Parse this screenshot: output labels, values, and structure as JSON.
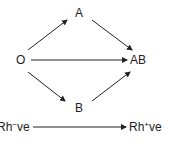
{
  "diagram": {
    "nodes": {
      "a": "A",
      "o": "O",
      "ab": "AB",
      "b": "B"
    },
    "rh": {
      "neg_base": "Rh",
      "neg_sup": "−",
      "neg_suffix": "ve",
      "pos_base": "Rh",
      "pos_sup": "+",
      "pos_suffix": "ve"
    },
    "edges": [
      {
        "from": "O",
        "to": "A"
      },
      {
        "from": "O",
        "to": "AB"
      },
      {
        "from": "O",
        "to": "B"
      },
      {
        "from": "A",
        "to": "AB"
      },
      {
        "from": "B",
        "to": "AB"
      },
      {
        "from": "Rh−ve",
        "to": "Rh+ve"
      }
    ],
    "colors": {
      "line": "#222222",
      "text": "#222222"
    }
  }
}
